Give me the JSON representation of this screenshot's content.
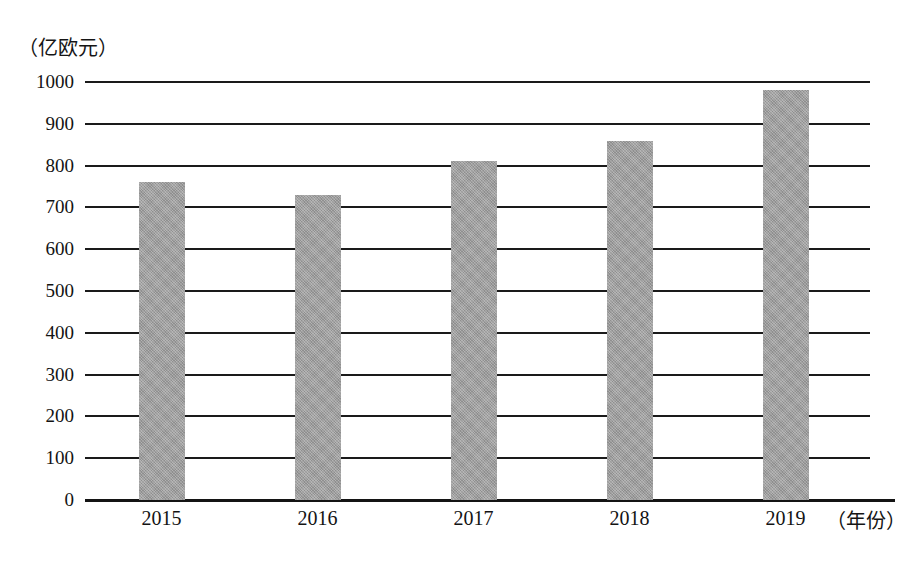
{
  "chart_data": {
    "type": "bar",
    "title": "",
    "subtitle": "",
    "xlabel": "（年份）",
    "ylabel": "（亿欧元）",
    "categories": [
      "2015",
      "2016",
      "2017",
      "2018",
      "2019"
    ],
    "values": [
      760,
      730,
      810,
      860,
      980
    ],
    "series": [
      {
        "name": "",
        "values": [
          760,
          730,
          810,
          860,
          980
        ]
      }
    ],
    "ylim": [
      0,
      1000
    ],
    "ytick_labels": [
      "0",
      "100",
      "200",
      "300",
      "400",
      "500",
      "600",
      "700",
      "800",
      "900",
      "1000"
    ],
    "ytick_values": [
      0,
      100,
      200,
      300,
      400,
      500,
      600,
      700,
      800,
      900,
      1000
    ],
    "grid": true,
    "grid_axis": "y",
    "legend": false,
    "legend_position": "none",
    "bar_color": "#9d9d9d",
    "axis_color": "#1a1a1a",
    "background_color": "#ffffff",
    "data_labels": false
  }
}
